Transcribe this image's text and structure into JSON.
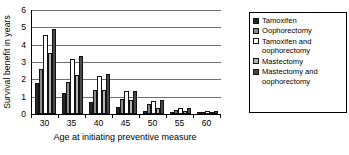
{
  "chart_data": {
    "type": "bar",
    "title": "",
    "subtitle": "",
    "xlabel": "Age at initiating preventive measure",
    "ylabel": "Survival benefit in years",
    "categories": [
      "30",
      "35",
      "40",
      "45",
      "50",
      "55",
      "60"
    ],
    "ylim": [
      0,
      6
    ],
    "yticks": [
      0,
      1,
      2,
      3,
      4,
      5,
      6
    ],
    "ytick_labels": [
      "0",
      "1",
      "2",
      "3",
      "4",
      "5",
      "6"
    ],
    "grid": true,
    "grid_axis": "y",
    "legend_position": "right",
    "series": [
      {
        "name": "Tamoxifen",
        "color": "#262626",
        "values": [
          1.8,
          1.2,
          0.7,
          0.4,
          0.2,
          0.08,
          0.03
        ]
      },
      {
        "name": "Oophorectomy",
        "color": "#8a8a8a",
        "values": [
          2.6,
          1.85,
          1.4,
          0.85,
          0.55,
          0.22,
          0.1
        ]
      },
      {
        "name": "Tamoxifen and\noophorectomy",
        "color": "#ffffff",
        "values": [
          4.55,
          3.15,
          2.2,
          1.3,
          0.75,
          0.32,
          0.15
        ]
      },
      {
        "name": "Mastectomy",
        "color": "#b5b5b5",
        "values": [
          3.5,
          2.25,
          1.4,
          0.8,
          0.35,
          0.15,
          0.06
        ]
      },
      {
        "name": "Mastectomy and\noophorectomy",
        "color": "#4a4a4a",
        "values": [
          4.9,
          3.35,
          2.3,
          1.35,
          0.78,
          0.33,
          0.15
        ]
      }
    ]
  }
}
